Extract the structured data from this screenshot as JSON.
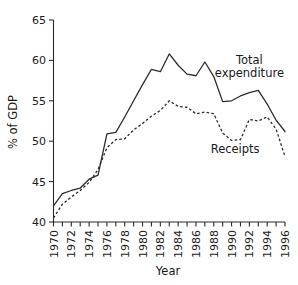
{
  "chart_data": {
    "type": "line",
    "title": "",
    "xlabel": "Year",
    "ylabel": "% of GDP",
    "xlim": [
      1970,
      1996
    ],
    "ylim": [
      40,
      65
    ],
    "yticks": [
      40,
      45,
      50,
      55,
      60,
      65
    ],
    "ytick_labels": [
      "40",
      "45",
      "50",
      "55",
      "60",
      "65"
    ],
    "xticks": [
      1970,
      1971,
      1972,
      1973,
      1974,
      1975,
      1976,
      1977,
      1978,
      1979,
      1980,
      1981,
      1982,
      1983,
      1984,
      1985,
      1986,
      1987,
      1988,
      1989,
      1990,
      1991,
      1992,
      1993,
      1994,
      1995,
      1996
    ],
    "xtick_labels": [
      "1970",
      "",
      "1972",
      "",
      "1974",
      "",
      "1976",
      "",
      "1978",
      "",
      "1980",
      "",
      "1982",
      "",
      "1984",
      "",
      "1986",
      "",
      "1988",
      "",
      "1990",
      "",
      "1992",
      "",
      "1994",
      "",
      "1996"
    ],
    "grid": false,
    "legend_position": "inline-annotation",
    "x": [
      1970,
      1971,
      1972,
      1973,
      1974,
      1975,
      1976,
      1977,
      1978,
      1979,
      1980,
      1981,
      1982,
      1983,
      1984,
      1985,
      1986,
      1987,
      1988,
      1989,
      1990,
      1991,
      1992,
      1993,
      1994,
      1995,
      1996
    ],
    "series": [
      {
        "name": "Total expenditure",
        "style": "solid",
        "color": "#2b2b2b",
        "values": [
          42.0,
          43.5,
          43.9,
          44.2,
          45.3,
          45.8,
          50.9,
          51.1,
          53.0,
          55.0,
          57.0,
          58.9,
          58.6,
          60.8,
          59.4,
          58.3,
          58.1,
          59.8,
          58.0,
          54.9,
          55.0,
          55.6,
          56.0,
          56.3,
          54.6,
          52.6,
          51.2
        ]
      },
      {
        "name": "Receipts",
        "style": "dashed",
        "color": "#2b2b2b",
        "values": [
          40.5,
          42.2,
          43.1,
          43.9,
          44.9,
          46.5,
          49.2,
          50.2,
          50.3,
          51.4,
          52.2,
          53.1,
          53.8,
          55.0,
          54.3,
          54.2,
          53.4,
          53.6,
          53.4,
          51.0,
          50.1,
          50.2,
          52.7,
          52.5,
          53.0,
          51.5,
          48.1
        ]
      }
    ],
    "annotations": [
      {
        "text": "Total",
        "x": 1992.0,
        "y": 59.6
      },
      {
        "text": "expenditure",
        "x": 1992.0,
        "y": 57.9
      },
      {
        "text": "Receipts",
        "x": 1990.4,
        "y": 48.6
      }
    ]
  }
}
